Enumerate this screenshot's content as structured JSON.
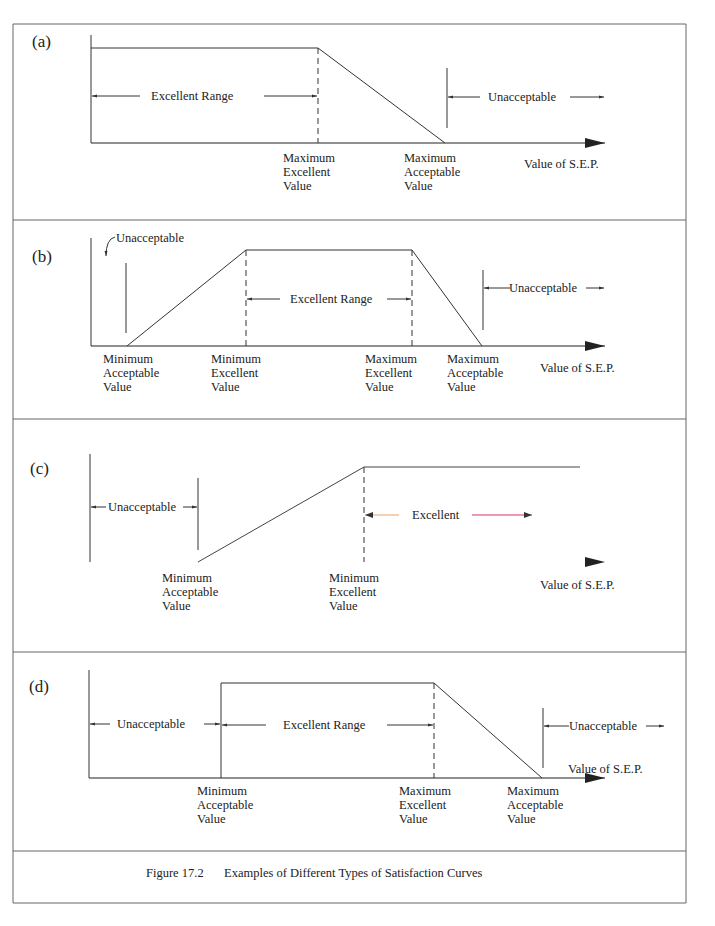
{
  "figure": {
    "caption_number": "Figure 17.2",
    "caption_text": "Examples of Different Types of Satisfaction Curves",
    "border_color": "#555555",
    "axis_title": "Value of S.E.P."
  },
  "panels": [
    {
      "id": "a",
      "label": "(a)",
      "ranges": [
        {
          "text": "Excellent Range"
        },
        {
          "text": "Unacceptable"
        }
      ],
      "ticks": [
        {
          "lines": [
            "Maximum",
            "Excellent",
            "Value"
          ]
        },
        {
          "lines": [
            "Maximum",
            "Acceptable",
            "Value"
          ]
        }
      ],
      "axis_title": "Value of S.E.P."
    },
    {
      "id": "b",
      "label": "(b)",
      "ranges": [
        {
          "text": "Unacceptable"
        },
        {
          "text": "Excellent Range"
        },
        {
          "text": "Unacceptable"
        }
      ],
      "ticks": [
        {
          "lines": [
            "Minimum",
            "Acceptable",
            "Value"
          ]
        },
        {
          "lines": [
            "Minimum",
            "Excellent",
            "Value"
          ]
        },
        {
          "lines": [
            "Maximum",
            "Excellent",
            "Value"
          ]
        },
        {
          "lines": [
            "Maximum",
            "Acceptable",
            "Value"
          ]
        }
      ],
      "axis_title": "Value of S.E.P."
    },
    {
      "id": "c",
      "label": "(c)",
      "ranges": [
        {
          "text": "Unacceptable"
        },
        {
          "text": "Excellent"
        }
      ],
      "ticks": [
        {
          "lines": [
            "Minimum",
            "Acceptable",
            "Value"
          ]
        },
        {
          "lines": [
            "Minimum",
            "Excellent",
            "Value"
          ]
        }
      ],
      "axis_title": "Value of S.E.P."
    },
    {
      "id": "d",
      "label": "(d)",
      "ranges": [
        {
          "text": "Unacceptable"
        },
        {
          "text": "Excellent Range"
        },
        {
          "text": "Unacceptable"
        }
      ],
      "ticks": [
        {
          "lines": [
            "Minimum",
            "Acceptable",
            "Value"
          ]
        },
        {
          "lines": [
            "Maximum",
            "Excellent",
            "Value"
          ]
        },
        {
          "lines": [
            "Maximum",
            "Acceptable",
            "Value"
          ]
        }
      ],
      "axis_title": "Value of S.E.P."
    }
  ],
  "colors": {
    "line": "#333333",
    "panel_c_excellent_left": "#e8a070",
    "panel_c_excellent_right": "#e0306a",
    "panel_c_axis_blue": "#5060e0",
    "panel_c_axis_red": "#d04050"
  }
}
